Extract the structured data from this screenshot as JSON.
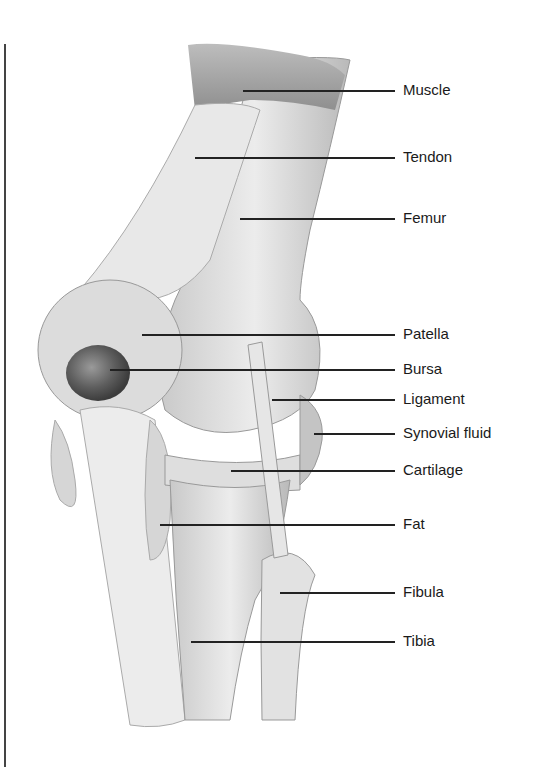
{
  "figure": {
    "labels": [
      {
        "id": "muscle",
        "text": "Muscle",
        "y": 90,
        "line_start_x": 243
      },
      {
        "id": "tendon",
        "text": "Tendon",
        "y": 157,
        "line_start_x": 195
      },
      {
        "id": "femur",
        "text": "Femur",
        "y": 218,
        "line_start_x": 240
      },
      {
        "id": "patella",
        "text": "Patella",
        "y": 334,
        "line_start_x": 142
      },
      {
        "id": "bursa",
        "text": "Bursa",
        "y": 369,
        "line_start_x": 110
      },
      {
        "id": "ligament",
        "text": "Ligament",
        "y": 399,
        "line_start_x": 272
      },
      {
        "id": "synovial-fluid",
        "text": "Synovial fluid",
        "y": 433,
        "line_start_x": 314
      },
      {
        "id": "cartilage",
        "text": "Cartilage",
        "y": 470,
        "line_start_x": 231
      },
      {
        "id": "fat",
        "text": "Fat",
        "y": 524,
        "line_start_x": 160
      },
      {
        "id": "fibula",
        "text": "Fibula",
        "y": 592,
        "line_start_x": 280
      },
      {
        "id": "tibia",
        "text": "Tibia",
        "y": 641,
        "line_start_x": 191
      }
    ],
    "line_end_x": 395,
    "label_x": 403
  },
  "colors": {
    "background": "#ffffff",
    "bone": "#e4e4e4",
    "shadow": "#a8a8a8",
    "muscle": "#9a9a9a",
    "bursa": "#555555",
    "leader": "#222222",
    "text": "#1a1a1a"
  }
}
